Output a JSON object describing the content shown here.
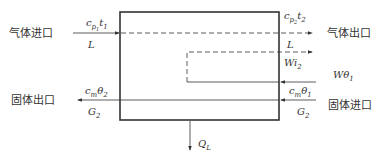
{
  "diagram": {
    "type": "energy_balance_schematic",
    "labels": {
      "gas_inlet": "气体进口",
      "gas_outlet": "气体出口",
      "solid_outlet": "固体出口",
      "solid_inlet": "固体进口"
    },
    "streams": {
      "gas_in": {
        "top": "c",
        "top_sub": "p",
        "top_subsub": "1",
        "top_var": "t",
        "top_var_sub": "1",
        "bottom": "L"
      },
      "gas_out": {
        "top": "c",
        "top_sub": "p",
        "top_subsub": "2",
        "top_var": "t",
        "top_var_sub": "2",
        "bottom": "L"
      },
      "vapor_out": {
        "label": "Wi",
        "label_sub": "2"
      },
      "water_in": {
        "label": "Wθ",
        "label_sub": "1"
      },
      "solid_out": {
        "top": "c",
        "top_sub": "m",
        "top_var": "θ",
        "top_var_sub": "2",
        "bottom": "G",
        "bottom_sub": "2"
      },
      "solid_in": {
        "top": "c",
        "top_sub": "m",
        "top_var": "θ",
        "top_var_sub": "1",
        "bottom": "G",
        "bottom_sub": "2"
      },
      "heat_loss": {
        "label": "Q",
        "label_sub": "L"
      }
    },
    "colors": {
      "line": "#333333",
      "background": "#ffffff"
    }
  }
}
